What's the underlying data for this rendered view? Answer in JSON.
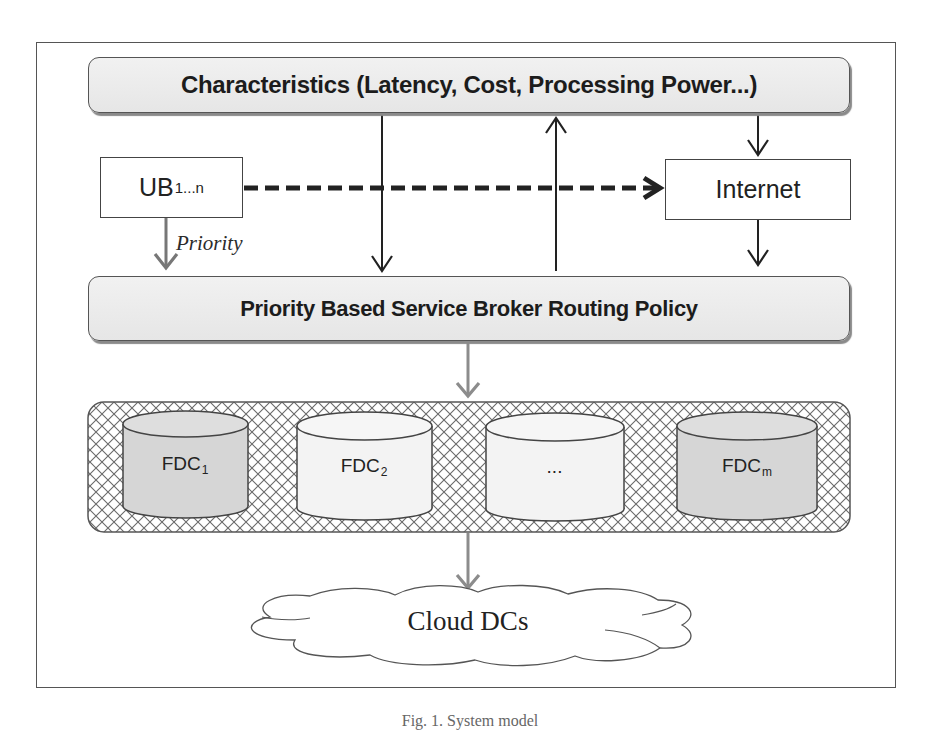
{
  "figure": {
    "characteristics_box": {
      "label": "Characteristics (Latency, Cost, Processing Power...)"
    },
    "user_base_box": {
      "label": "UB",
      "subscript": "1...n"
    },
    "internet_box": {
      "label": "Internet"
    },
    "priority_edge": {
      "label": "Priority"
    },
    "policy_box": {
      "label": "Priority Based Service Broker Routing Policy"
    },
    "fog_datacenters": [
      {
        "label": "FDC",
        "subscript": "1",
        "fill": "#d6d6d6"
      },
      {
        "label": "FDC",
        "subscript": "2",
        "fill": "#f3f3f3"
      },
      {
        "label": "...",
        "subscript": "",
        "fill": "#f3f3f3"
      },
      {
        "label": "FDC",
        "subscript": "m",
        "fill": "#d6d6d6"
      }
    ],
    "cloud": {
      "label": "Cloud DCs"
    },
    "caption": "Fig. 1. System model"
  },
  "colors": {
    "line_dark": "#222222",
    "line_gray": "#8c8c8c",
    "box_fill": "#ececec",
    "hatch": "#666666"
  }
}
